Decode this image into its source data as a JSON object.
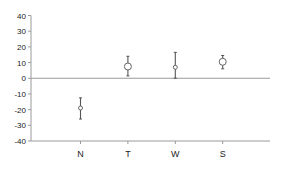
{
  "chart_data": {
    "type": "scatter",
    "subtype": "error-bar",
    "title": "",
    "xlabel": "",
    "ylabel": "",
    "categories": [
      "N",
      "T",
      "W",
      "S"
    ],
    "ylim": [
      -40,
      40
    ],
    "yticks": [
      40,
      30,
      20,
      10,
      0,
      -10,
      -20,
      -30,
      -40
    ],
    "grid": false,
    "legend": null,
    "zero_line": true,
    "series": [
      {
        "name": "",
        "values": [
          -19,
          7.5,
          7,
          10.5
        ],
        "lower": [
          -26,
          1.5,
          0,
          6
        ],
        "upper": [
          -12.5,
          14,
          16.5,
          14.5
        ]
      }
    ]
  },
  "colors": {
    "axis": "#9a9a9a",
    "zero_line": "#9a9a9a",
    "error_bar": "#555555",
    "marker_stroke": "#666666",
    "marker_fill": "#ffffff",
    "text": "#222222"
  }
}
